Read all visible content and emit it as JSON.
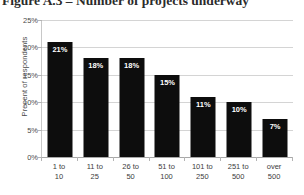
{
  "figure": {
    "title": "Figure A.3 – Number of projects underway"
  },
  "chart_data": {
    "type": "bar",
    "title": "Figure A.3 – Number of projects underway",
    "xlabel": "",
    "ylabel": "Precent of respondents",
    "categories": [
      "1 to 10",
      "11 to 25",
      "26 to 50",
      "51 to 100",
      "101 to 250",
      "251 to 500",
      "over 500"
    ],
    "category_lines": [
      [
        "1 to",
        "10"
      ],
      [
        "11 to",
        "25"
      ],
      [
        "26 to",
        "50"
      ],
      [
        "51 to",
        "100"
      ],
      [
        "101 to",
        "250"
      ],
      [
        "251 to",
        "500"
      ],
      [
        "over",
        "500"
      ]
    ],
    "values": [
      21,
      18,
      18,
      15,
      11,
      10,
      7
    ],
    "data_labels": [
      "21%",
      "18%",
      "18%",
      "15%",
      "11%",
      "10%",
      "7%"
    ],
    "ylim": [
      0,
      25
    ],
    "ytick_values": [
      0,
      5,
      10,
      15,
      20,
      25
    ],
    "ytick_labels": [
      "0%",
      "5%",
      "10%",
      "15%",
      "20%",
      "25%"
    ],
    "grid": true,
    "legend": false,
    "bar_color": "#0d0d0d",
    "data_label_color": "#ffffff",
    "gridline_color": "#d4d4d4",
    "axis_color": "#b4b4b4"
  }
}
